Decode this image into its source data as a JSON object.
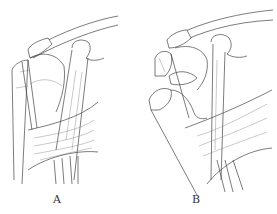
{
  "figure": {
    "panels": [
      {
        "id": "A",
        "label": "A"
      },
      {
        "id": "B",
        "label": "B"
      }
    ],
    "colors": {
      "line": "#444444",
      "background": "#ffffff"
    }
  }
}
